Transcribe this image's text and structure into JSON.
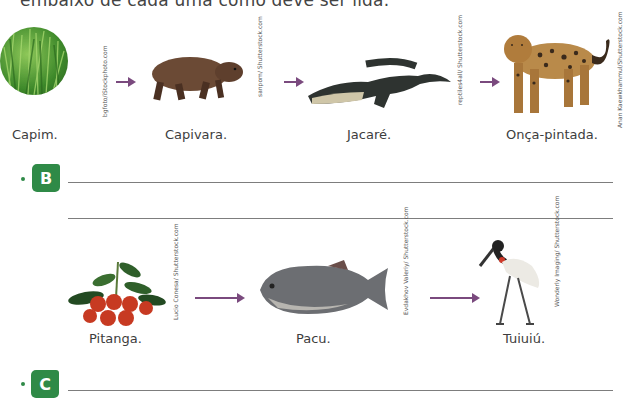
{
  "instruction_fragment": "embaixo de cada uma como deve ser lida.",
  "chain_a": {
    "items": [
      {
        "label": "Capim.",
        "icon": "grass-image",
        "credit": "bgfoto/iStockphoto.com"
      },
      {
        "label": "Capivara.",
        "icon": "capybara-image",
        "credit": "sanpom/ Shutterstock.com"
      },
      {
        "label": "Jacaré.",
        "icon": "alligator-image",
        "credit": "reptiles4all/ Shutterstock.com"
      },
      {
        "label": "Onça-pintada.",
        "icon": "jaguar-image",
        "credit": "Anan Kaewkhammul/Shutterstock.com"
      }
    ]
  },
  "question_b": {
    "letter": "B",
    "answer_line_1": "",
    "answer_line_2": ""
  },
  "chain_b": {
    "items": [
      {
        "label": "Pitanga.",
        "icon": "pitanga-fruit-image",
        "credit": "Lucio Conesa/ Shutterstock.com"
      },
      {
        "label": "Pacu.",
        "icon": "pacu-fish-image",
        "credit": "Evdakhov Valeriy/ Shutterstock.com"
      },
      {
        "label": "Tuiuiú.",
        "icon": "jabiru-stork-image",
        "credit": "Wonderly Imaging/ Shutterstock.com"
      }
    ]
  },
  "question_c": {
    "letter": "C",
    "answer_line_1": ""
  },
  "colors": {
    "badge_green": "#2f8a47",
    "arrow_purple": "#7a4a7e"
  }
}
